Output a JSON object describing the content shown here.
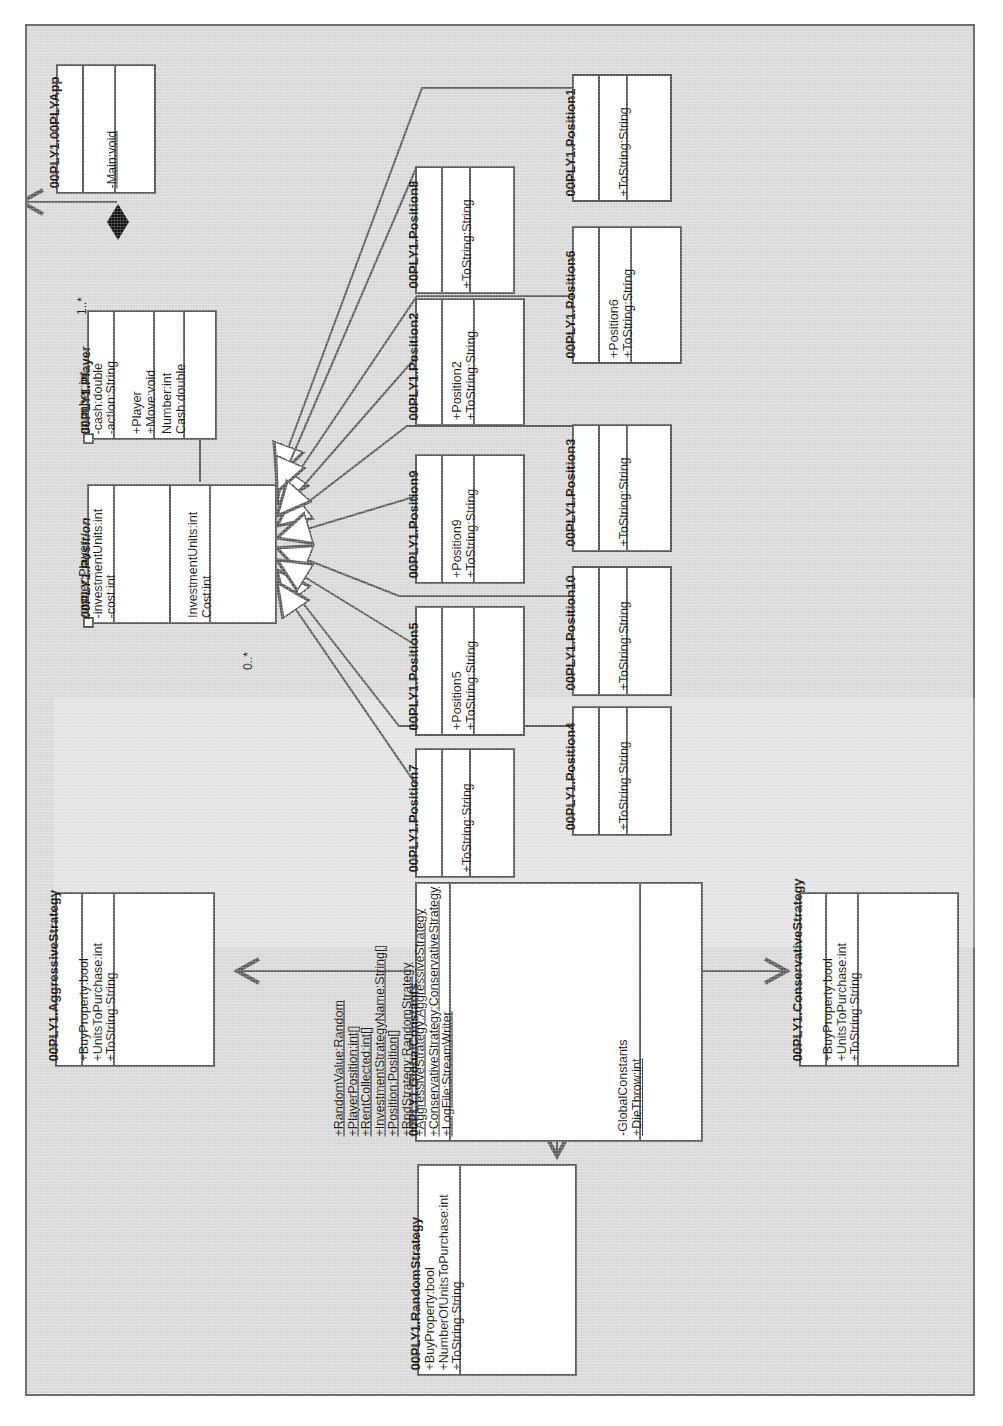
{
  "diagram": {
    "notation": "UML",
    "orientation": "rotated-90",
    "line_color": "#5a5a5a",
    "box_fill": "#ffffff",
    "page_fill": "#d8d8d8"
  },
  "classes": {
    "app": {
      "name": "00PLY1.00PLYApp",
      "stereotype": "",
      "abstract": false,
      "attributes": [],
      "methods": [
        "-Main:void"
      ],
      "properties": []
    },
    "player": {
      "name": "00PLY1.Player",
      "abstract": false,
      "attributes": [
        "-number:int",
        "-cash:double",
        "-action:String"
      ],
      "methods": [
        "+Player",
        "+Move:void"
      ],
      "properties": [
        "Number:int",
        "Cash:double"
      ]
    },
    "position": {
      "name": "00PLY1.Position",
      "abstract": true,
      "attributes": [
        "-owner:Player",
        "-investmentUnits:int",
        "-cost:int"
      ],
      "methods": [],
      "properties": [
        "InvestmentUnits:int",
        "Cost:int"
      ]
    },
    "position1": {
      "name": "00PLY1.Position1",
      "attributes": [],
      "methods": [
        "+ToString:String"
      ]
    },
    "position2": {
      "name": "00PLY1.Position2",
      "attributes": [],
      "methods": [
        "+Position2",
        "+ToString:String"
      ]
    },
    "position3": {
      "name": "00PLY1.Position3",
      "attributes": [],
      "methods": [
        "+ToString:String"
      ]
    },
    "position4": {
      "name": "00PLY1.Position4",
      "attributes": [],
      "methods": [
        "+ToString:String"
      ]
    },
    "position5": {
      "name": "00PLY1.Position5",
      "attributes": [],
      "methods": [
        "+Position5",
        "+ToString:String"
      ]
    },
    "position6": {
      "name": "00PLY1.Position6",
      "attributes": [],
      "methods": [
        "+Position6",
        "+ToString:String"
      ]
    },
    "position7": {
      "name": "00PLY1.Position7",
      "attributes": [],
      "methods": [
        "+ToString:String"
      ]
    },
    "position8": {
      "name": "00PLY1.Position8",
      "attributes": [],
      "methods": [
        "+ToString:String"
      ]
    },
    "position9": {
      "name": "00PLY1.Position9",
      "attributes": [],
      "methods": [
        "+Position9",
        "+ToString:String"
      ]
    },
    "position10": {
      "name": "00PLY1.Position10",
      "attributes": [],
      "methods": [
        "+ToString:String"
      ]
    },
    "globalconstants": {
      "name": "00PLY1.GlobalConstants",
      "abstract": false,
      "attributes": [
        "+RandomValue:Random",
        "+PlayerPosition:int[]",
        "+RentCollected:int[]",
        "+InvestmentStrategyName:String[]",
        "+Position:Position[]",
        "+RndStrategy:RandomStrategy",
        "+AggressiveStrategy:AggressiveStrategy",
        "+ConservativeStrategy:ConservativeStrategy",
        "+LogFile:StreamWriter"
      ],
      "attributes_static": true,
      "methods": [
        "-GlobalConstants",
        "+DieThrow:int"
      ],
      "methods_static": [
        false,
        true
      ]
    },
    "aggressive": {
      "name": "00PLY1.AggressiveStrategy",
      "attributes": [],
      "methods": [
        "+BuyProperty:bool",
        "+UnitsToPurchase:int",
        "+ToString:String"
      ]
    },
    "conservative": {
      "name": "00PLY1.ConservativeStrategy",
      "attributes": [],
      "methods": [
        "+BuyProperty:bool",
        "+UnitsToPurchase:int",
        "+ToString:String"
      ]
    },
    "random": {
      "name": "00PLY1.RandomStrategy",
      "methods": [
        "+BuyProperty:bool",
        "+NumberOfUnitsToPurchase:int",
        "+ToString:String"
      ]
    }
  },
  "relationships": [
    {
      "id": "app-player",
      "type": "composition",
      "from": "00PLY1.00PLYApp",
      "to": "00PLY1.Player",
      "multiplicity": "1..*"
    },
    {
      "id": "position-player",
      "type": "association",
      "from": "00PLY1.Position",
      "to": "00PLY1.Player",
      "multiplicity": "0..*"
    },
    {
      "id": "gen-1",
      "type": "generalization",
      "from": "00PLY1.Position1",
      "to": "00PLY1.Position"
    },
    {
      "id": "gen-2",
      "type": "generalization",
      "from": "00PLY1.Position2",
      "to": "00PLY1.Position"
    },
    {
      "id": "gen-3",
      "type": "generalization",
      "from": "00PLY1.Position3",
      "to": "00PLY1.Position"
    },
    {
      "id": "gen-4",
      "type": "generalization",
      "from": "00PLY1.Position4",
      "to": "00PLY1.Position"
    },
    {
      "id": "gen-5",
      "type": "generalization",
      "from": "00PLY1.Position5",
      "to": "00PLY1.Position"
    },
    {
      "id": "gen-6",
      "type": "generalization",
      "from": "00PLY1.Position6",
      "to": "00PLY1.Position"
    },
    {
      "id": "gen-7",
      "type": "generalization",
      "from": "00PLY1.Position7",
      "to": "00PLY1.Position"
    },
    {
      "id": "gen-8",
      "type": "generalization",
      "from": "00PLY1.Position8",
      "to": "00PLY1.Position"
    },
    {
      "id": "gen-9",
      "type": "generalization",
      "from": "00PLY1.Position9",
      "to": "00PLY1.Position"
    },
    {
      "id": "gen-10",
      "type": "generalization",
      "from": "00PLY1.Position10",
      "to": "00PLY1.Position"
    },
    {
      "id": "gc-aggressive",
      "type": "association",
      "from": "00PLY1.GlobalConstants",
      "to": "00PLY1.AggressiveStrategy"
    },
    {
      "id": "gc-conservative",
      "type": "association",
      "from": "00PLY1.GlobalConstants",
      "to": "00PLY1.ConservativeStrategy"
    },
    {
      "id": "gc-random",
      "type": "association",
      "from": "00PLY1.GlobalConstants",
      "to": "00PLY1.RandomStrategy"
    }
  ],
  "labels": {
    "mult_app_player": "1..*",
    "mult_position": "0..*"
  }
}
